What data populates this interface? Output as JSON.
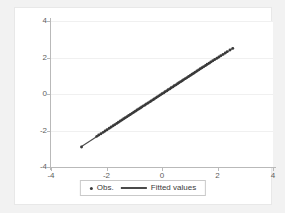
{
  "chart_data": {
    "type": "scatter",
    "title": "",
    "xlabel": "",
    "ylabel": "",
    "xlim": [
      -4,
      4
    ],
    "ylim": [
      -4,
      4
    ],
    "grid": "horizontal",
    "legend_position": "bottom-center",
    "xticks": [
      "-4",
      "-2",
      "0",
      "2",
      "4"
    ],
    "xtick_values": [
      -4,
      -2,
      0,
      2,
      4
    ],
    "yticks": [
      "-4",
      "-2",
      "0",
      "2",
      "4"
    ],
    "ytick_values": [
      -4,
      -2,
      0,
      2,
      4
    ],
    "series": [
      {
        "name": "Obs.",
        "type": "scatter",
        "marker": "dot",
        "color": "#3a3a3a",
        "x": [
          -2.9,
          -2.35,
          -2.28,
          -2.2,
          -2.12,
          -2.05,
          -1.98,
          -1.9,
          -1.83,
          -1.76,
          -1.7,
          -1.63,
          -1.57,
          -1.5,
          -1.44,
          -1.38,
          -1.32,
          -1.26,
          -1.2,
          -1.14,
          -1.08,
          -1.02,
          -0.96,
          -0.9,
          -0.84,
          -0.78,
          -0.73,
          -0.67,
          -0.61,
          -0.56,
          -0.5,
          -0.44,
          -0.39,
          -0.33,
          -0.28,
          -0.22,
          -0.17,
          -0.11,
          -0.06,
          0.0,
          0.06,
          0.11,
          0.17,
          0.22,
          0.28,
          0.33,
          0.39,
          0.44,
          0.5,
          0.56,
          0.61,
          0.67,
          0.73,
          0.78,
          0.84,
          0.9,
          0.96,
          1.02,
          1.08,
          1.14,
          1.2,
          1.26,
          1.32,
          1.38,
          1.44,
          1.5,
          1.57,
          1.63,
          1.7,
          1.76,
          1.83,
          1.9,
          1.98,
          2.05,
          2.12,
          2.2,
          2.28,
          2.35,
          2.45,
          2.55
        ],
        "y": [
          -2.9,
          -2.32,
          -2.25,
          -2.18,
          -2.1,
          -2.03,
          -1.96,
          -1.88,
          -1.81,
          -1.74,
          -1.68,
          -1.61,
          -1.55,
          -1.48,
          -1.42,
          -1.36,
          -1.3,
          -1.24,
          -1.18,
          -1.12,
          -1.06,
          -1.0,
          -0.94,
          -0.88,
          -0.82,
          -0.77,
          -0.71,
          -0.65,
          -0.6,
          -0.54,
          -0.49,
          -0.43,
          -0.38,
          -0.32,
          -0.27,
          -0.21,
          -0.16,
          -0.1,
          -0.05,
          0.01,
          0.06,
          0.12,
          0.17,
          0.23,
          0.28,
          0.34,
          0.39,
          0.45,
          0.5,
          0.56,
          0.62,
          0.67,
          0.73,
          0.79,
          0.84,
          0.9,
          0.96,
          1.02,
          1.08,
          1.14,
          1.2,
          1.26,
          1.32,
          1.38,
          1.44,
          1.5,
          1.56,
          1.63,
          1.69,
          1.76,
          1.82,
          1.89,
          1.96,
          2.03,
          2.1,
          2.17,
          2.25,
          2.32,
          2.41,
          2.5
        ]
      },
      {
        "name": "Fitted values",
        "type": "line",
        "color": "#4a4a4a",
        "x": [
          -2.9,
          2.55
        ],
        "y": [
          -2.88,
          2.5
        ]
      }
    ]
  },
  "legend": {
    "entries": [
      {
        "label": "Obs.",
        "marker": "dot-marker"
      },
      {
        "label": "Fitted values",
        "marker": "line-marker"
      }
    ]
  },
  "colors": {
    "figure_background": "#f2f2f2",
    "plot_background": "#ffffff",
    "axis": "#b9b9b9",
    "gridline": "#f0f0f0",
    "tick_text": "#5c5c5c",
    "data": "#3a3a3a"
  }
}
